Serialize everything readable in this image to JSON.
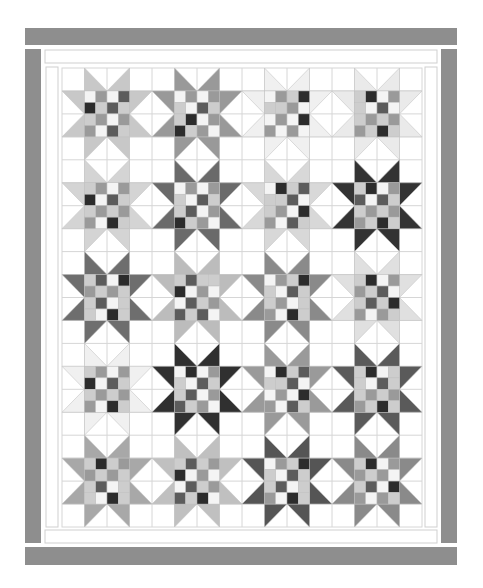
{
  "quilt": {
    "title": "Sawtooth star sampler quilt",
    "rows": 5,
    "cols": 4,
    "colors": {
      "background": "#ffffff",
      "outer_border": "#8e8e8e",
      "inner_strip": "#ffffff",
      "grid_line": "#d6d6d6",
      "strip_line": "#cfcfcf"
    },
    "palette": {
      "W": "#f4f4f4",
      "L": "#cdcdcd",
      "M": "#9a9a9a",
      "D": "#5c5c5c",
      "K": "#2c2c2c"
    },
    "stars": [
      [
        {
          "points": "#c8c8c8",
          "checker": [
            [
              "W",
              "M",
              "W",
              "D"
            ],
            [
              "K",
              "L",
              "D",
              "L"
            ],
            [
              "L",
              "M",
              "W",
              "M"
            ],
            [
              "M",
              "W",
              "D",
              "L"
            ]
          ]
        },
        {
          "points": "#999999",
          "checker": [
            [
              "W",
              "M",
              "W",
              "M"
            ],
            [
              "L",
              "W",
              "D",
              "L"
            ],
            [
              "L",
              "K",
              "W",
              "M"
            ],
            [
              "K",
              "L",
              "M",
              "W"
            ]
          ]
        },
        {
          "points": "#f0f0f0",
          "checker": [
            [
              "W",
              "M",
              "L",
              "K"
            ],
            [
              "L",
              "L",
              "M",
              "W"
            ],
            [
              "W",
              "M",
              "W",
              "K"
            ],
            [
              "M",
              "W",
              "M",
              "W"
            ]
          ]
        },
        {
          "points": "#eaeaea",
          "checker": [
            [
              "L",
              "K",
              "W",
              "M"
            ],
            [
              "L",
              "W",
              "D",
              "W"
            ],
            [
              "L",
              "M",
              "L",
              "M"
            ],
            [
              "M",
              "L",
              "K",
              "L"
            ]
          ]
        }
      ],
      [
        {
          "points": "#d4d4d4",
          "checker": [
            [
              "L",
              "M",
              "W",
              "M"
            ],
            [
              "K",
              "W",
              "D",
              "L"
            ],
            [
              "L",
              "M",
              "L",
              "M"
            ],
            [
              "M",
              "W",
              "K",
              "L"
            ]
          ]
        },
        {
          "points": "#6a6a6a",
          "checker": [
            [
              "W",
              "M",
              "W",
              "M"
            ],
            [
              "L",
              "W",
              "D",
              "L"
            ],
            [
              "L",
              "D",
              "W",
              "M"
            ],
            [
              "K",
              "L",
              "M",
              "W"
            ]
          ]
        },
        {
          "points": "#d8d8d8",
          "checker": [
            [
              "W",
              "K",
              "L",
              "D"
            ],
            [
              "L",
              "L",
              "D",
              "W"
            ],
            [
              "L",
              "M",
              "W",
              "K"
            ],
            [
              "M",
              "W",
              "D",
              "L"
            ]
          ]
        },
        {
          "points": "#333333",
          "checker": [
            [
              "L",
              "K",
              "W",
              "M"
            ],
            [
              "D",
              "W",
              "D",
              "L"
            ],
            [
              "L",
              "M",
              "L",
              "M"
            ],
            [
              "M",
              "L",
              "K",
              "L"
            ]
          ]
        }
      ],
      [
        {
          "points": "#6e6e6e",
          "checker": [
            [
              "L",
              "D",
              "W",
              "K"
            ],
            [
              "M",
              "L",
              "M",
              "L"
            ],
            [
              "L",
              "D",
              "W",
              "L"
            ],
            [
              "L",
              "W",
              "K",
              "L"
            ]
          ]
        },
        {
          "points": "#bcbcbc",
          "checker": [
            [
              "L",
              "D",
              "L",
              "L"
            ],
            [
              "K",
              "W",
              "M",
              "W"
            ],
            [
              "W",
              "D",
              "L",
              "M"
            ],
            [
              "D",
              "L",
              "D",
              "W"
            ]
          ]
        },
        {
          "points": "#8a8a8a",
          "checker": [
            [
              "W",
              "M",
              "L",
              "K"
            ],
            [
              "L",
              "W",
              "D",
              "L"
            ],
            [
              "L",
              "M",
              "W",
              "L"
            ],
            [
              "M",
              "W",
              "K",
              "L"
            ]
          ]
        },
        {
          "points": "#e0e0e0",
          "checker": [
            [
              "L",
              "K",
              "W",
              "M"
            ],
            [
              "M",
              "L",
              "D",
              "W"
            ],
            [
              "L",
              "D",
              "L",
              "K"
            ],
            [
              "M",
              "W",
              "M",
              "L"
            ]
          ]
        }
      ],
      [
        {
          "points": "#f0f0f0",
          "checker": [
            [
              "L",
              "M",
              "W",
              "M"
            ],
            [
              "K",
              "W",
              "D",
              "L"
            ],
            [
              "L",
              "M",
              "L",
              "M"
            ],
            [
              "M",
              "W",
              "K",
              "L"
            ]
          ]
        },
        {
          "points": "#303030",
          "checker": [
            [
              "W",
              "K",
              "W",
              "M"
            ],
            [
              "L",
              "W",
              "D",
              "L"
            ],
            [
              "L",
              "D",
              "W",
              "M"
            ],
            [
              "D",
              "L",
              "M",
              "W"
            ]
          ]
        },
        {
          "points": "#9a9a9a",
          "checker": [
            [
              "W",
              "K",
              "L",
              "D"
            ],
            [
              "L",
              "L",
              "D",
              "W"
            ],
            [
              "W",
              "M",
              "W",
              "K"
            ],
            [
              "M",
              "W",
              "D",
              "L"
            ]
          ]
        },
        {
          "points": "#5a5a5a",
          "checker": [
            [
              "L",
              "K",
              "W",
              "L"
            ],
            [
              "L",
              "W",
              "D",
              "L"
            ],
            [
              "L",
              "M",
              "L",
              "M"
            ],
            [
              "M",
              "L",
              "K",
              "L"
            ]
          ]
        }
      ],
      [
        {
          "points": "#a8a8a8",
          "checker": [
            [
              "L",
              "K",
              "L",
              "M"
            ],
            [
              "M",
              "L",
              "M",
              "L"
            ],
            [
              "L",
              "D",
              "W",
              "L"
            ],
            [
              "L",
              "W",
              "K",
              "L"
            ]
          ]
        },
        {
          "points": "#c0c0c0",
          "checker": [
            [
              "L",
              "D",
              "L",
              "M"
            ],
            [
              "K",
              "W",
              "M",
              "W"
            ],
            [
              "W",
              "D",
              "L",
              "M"
            ],
            [
              "D",
              "L",
              "K",
              "W"
            ]
          ]
        },
        {
          "points": "#555555",
          "checker": [
            [
              "W",
              "M",
              "L",
              "K"
            ],
            [
              "L",
              "W",
              "D",
              "L"
            ],
            [
              "L",
              "D",
              "W",
              "L"
            ],
            [
              "M",
              "W",
              "K",
              "L"
            ]
          ]
        },
        {
          "points": "#8a8a8a",
          "checker": [
            [
              "L",
              "K",
              "W",
              "M"
            ],
            [
              "M",
              "L",
              "M",
              "W"
            ],
            [
              "L",
              "D",
              "W",
              "K"
            ],
            [
              "M",
              "W",
              "M",
              "L"
            ]
          ]
        }
      ]
    ]
  }
}
